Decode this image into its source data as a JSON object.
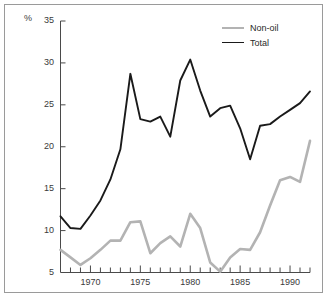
{
  "chart_data": {
    "type": "line",
    "title": "",
    "subtitle": "",
    "xlabel": "",
    "ylabel": "%",
    "unit_label": "%",
    "xlim": [
      1967,
      1992
    ],
    "ylim": [
      5,
      35
    ],
    "ytick_labels": [
      "5",
      "10",
      "15",
      "20",
      "25",
      "30",
      "35"
    ],
    "yticks": [
      5,
      10,
      15,
      20,
      25,
      30,
      35
    ],
    "xtick_labels": [
      "1970",
      "1975",
      "1980",
      "1985",
      "1990"
    ],
    "xticks": [
      1970,
      1975,
      1980,
      1985,
      1990
    ],
    "minor_xticks_every": 1,
    "grid": false,
    "legend_position": "top-right",
    "x": [
      1967,
      1968,
      1969,
      1970,
      1971,
      1972,
      1973,
      1974,
      1975,
      1976,
      1977,
      1978,
      1979,
      1980,
      1981,
      1982,
      1983,
      1984,
      1985,
      1986,
      1987,
      1988,
      1989,
      1990,
      1991,
      1992
    ],
    "series": [
      {
        "name": "Total",
        "color": "#1a1a1a",
        "linewidth": 1.9,
        "values": [
          11.7,
          10.3,
          10.2,
          11.8,
          13.6,
          16.1,
          19.7,
          28.7,
          23.3,
          23.0,
          23.6,
          21.2,
          27.9,
          30.4,
          26.7,
          23.6,
          24.6,
          24.9,
          22.2,
          18.5,
          22.5,
          22.7,
          23.6,
          24.4,
          25.2,
          26.6
        ]
      },
      {
        "name": "Non-oil",
        "color": "#b3b3b3",
        "linewidth": 2.6,
        "values": [
          7.7,
          6.8,
          5.9,
          6.7,
          7.7,
          8.8,
          8.8,
          11.0,
          11.1,
          7.3,
          8.5,
          9.3,
          8.1,
          12.0,
          10.3,
          6.2,
          5.1,
          6.8,
          7.8,
          7.7,
          9.8,
          13.0,
          16.0,
          16.4,
          15.8,
          20.7
        ]
      }
    ]
  },
  "legend": {
    "items": [
      {
        "label": "Non-oil",
        "color": "#b3b3b3",
        "width": 2.6
      },
      {
        "label": "Total",
        "color": "#1a1a1a",
        "width": 1.9
      }
    ]
  }
}
